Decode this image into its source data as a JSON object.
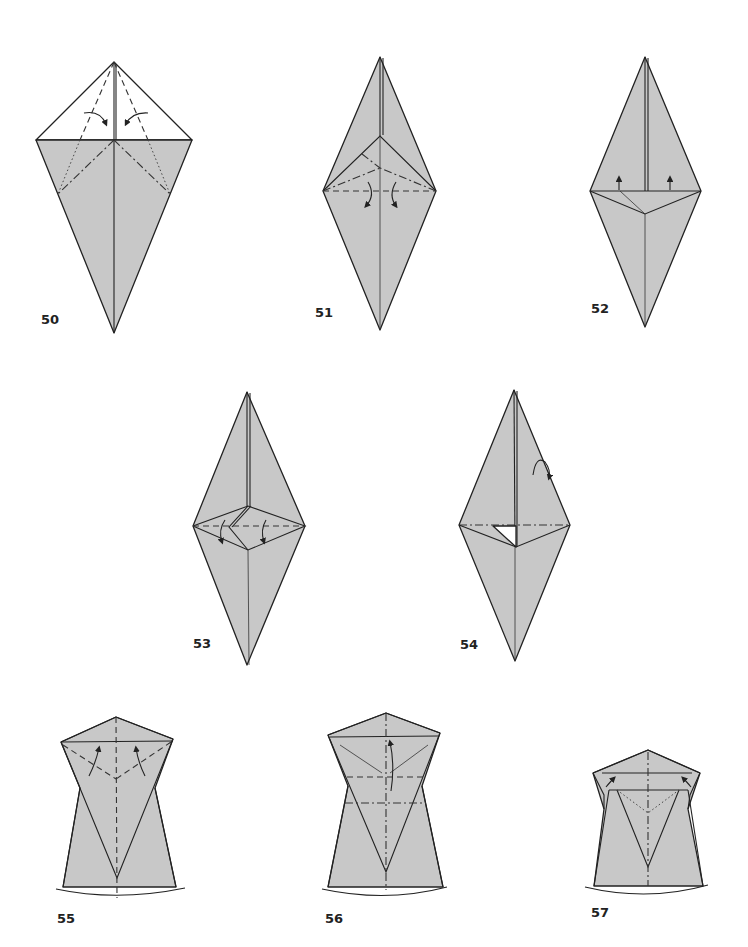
{
  "page": {
    "background": "#ffffff",
    "paper_color": "#c8c8c8",
    "line_color": "#222222"
  },
  "steps": [
    {
      "number": "50",
      "description": "white top flap, valley folds from apex, mountain folds, arrows fold inward"
    },
    {
      "number": "51",
      "description": "diamond with inner triangle, mountain and valley fold lines, arrows fold down"
    },
    {
      "number": "52",
      "description": "diamond with flap lifted, two up arrows"
    },
    {
      "number": "53",
      "description": "diamond with squash fold, valley line with two arrows"
    },
    {
      "number": "54",
      "description": "diamond with small white triangle, turn-over arrow"
    },
    {
      "number": "55",
      "description": "bottom view, two arrows up, valley folds"
    },
    {
      "number": "56",
      "description": "valley and mountain fold lines, one arrow up"
    },
    {
      "number": "57",
      "description": "two corner arrows, x-ray dotted line"
    }
  ]
}
